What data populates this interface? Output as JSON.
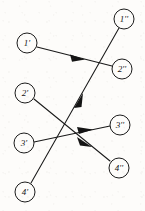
{
  "diagram": {
    "type": "bipartite-mapping",
    "background_color": "#fdfcfa",
    "stroke_color": "#191919",
    "node_radius": 10,
    "source_nodes": [
      {
        "id": "n1p",
        "label": "1'",
        "x": 27,
        "y": 43
      },
      {
        "id": "n2p",
        "label": "2'",
        "x": 25,
        "y": 93
      },
      {
        "id": "n3p",
        "label": "3'",
        "x": 24,
        "y": 143
      },
      {
        "id": "n4p",
        "label": "4'",
        "x": 25,
        "y": 192
      }
    ],
    "target_nodes": [
      {
        "id": "n1pp",
        "label": "1''",
        "x": 124,
        "y": 19
      },
      {
        "id": "n2pp",
        "label": "2''",
        "x": 122,
        "y": 69
      },
      {
        "id": "n3pp",
        "label": "3''",
        "x": 120,
        "y": 125
      },
      {
        "id": "n4pp",
        "label": "4''",
        "x": 119,
        "y": 168
      }
    ],
    "edges": [
      {
        "id": "e1",
        "from": "1'",
        "to": "2''",
        "x1": 37,
        "y1": 47,
        "x2": 112,
        "y2": 66,
        "arrow_x": 78,
        "arrow_y": 57
      },
      {
        "id": "e2",
        "from": "2'",
        "to": "4''",
        "x1": 34,
        "y1": 99,
        "x2": 110,
        "y2": 161,
        "arrow_x": 86,
        "arrow_y": 142
      },
      {
        "id": "e3",
        "from": "3'",
        "to": "3''",
        "x1": 34,
        "y1": 142,
        "x2": 110,
        "y2": 126,
        "arrow_x": 86,
        "arrow_y": 130
      },
      {
        "id": "e4",
        "from": "4'",
        "to": "1''",
        "x1": 31,
        "y1": 183,
        "x2": 119,
        "y2": 28,
        "arrow_x": 79,
        "arrow_y": 100
      }
    ]
  }
}
